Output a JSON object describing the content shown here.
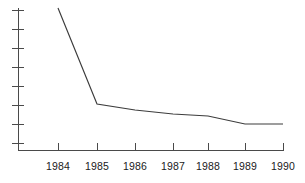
{
  "chart_data": {
    "type": "line",
    "title": "",
    "subtitle": "",
    "xlabel": "",
    "ylabel": "",
    "grid": false,
    "legend": false,
    "legend_position": "none",
    "categories": [
      "1984",
      "1985",
      "1986",
      "1987",
      "1988",
      "1989",
      "1990"
    ],
    "x": [
      1984,
      1985,
      1986,
      1987,
      1988,
      1989,
      1990
    ],
    "xlim": [
      1983.6,
      1990.2
    ],
    "ylim": [
      0,
      8
    ],
    "y_axis_ticks_count": 8,
    "y_axis_tick_labels": [],
    "x_tick_labels": [
      "1984",
      "1985",
      "1986",
      "1987",
      "1988",
      "1989",
      "1990"
    ],
    "series": [
      {
        "name": "series-1",
        "color": "#3c3c3c",
        "values": [
          7.5,
          2.3,
          2.0,
          1.75,
          1.65,
          1.2,
          1.2
        ]
      }
    ],
    "annotations": [],
    "pixel_geometry": {
      "plot_left": 18,
      "plot_right": 283,
      "plot_top": 8,
      "plot_bottom": 150,
      "x_positions": [
        58,
        97,
        135,
        173,
        208,
        245,
        283
      ],
      "y_positions": [
        8,
        104,
        110,
        114,
        116,
        124,
        124
      ],
      "y_tick_positions": [
        10,
        29,
        48,
        67,
        86,
        105,
        124,
        143
      ],
      "axis_color": "#4a4a4a",
      "line_color": "#3c3c3c"
    }
  }
}
